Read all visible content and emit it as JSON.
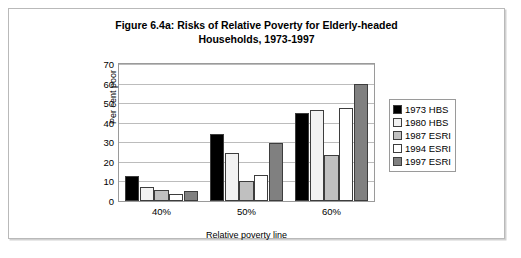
{
  "figure": {
    "title_line1": "Figure 6.4a: Risks of Relative Poverty for Elderly-headed",
    "title_line2": "Households, 1973-1997"
  },
  "chart_data": {
    "type": "bar",
    "title": "Figure 6.4a: Risks of Relative Poverty for Elderly-headed Households, 1973-1997",
    "xlabel": "Relative poverty line",
    "ylabel": "Per cent poor",
    "categories": [
      "40%",
      "50%",
      "60%"
    ],
    "series": [
      {
        "name": "1973 HBS",
        "color": "#000000",
        "values": [
          13,
          34,
          45
        ]
      },
      {
        "name": "1980 HBS",
        "color": "#f2f2f2",
        "values": [
          7,
          24.5,
          46.5
        ]
      },
      {
        "name": "1987 ESRI",
        "color": "#c0c0c0",
        "values": [
          5.5,
          10,
          23.5
        ]
      },
      {
        "name": "1994 ESRI",
        "color": "#ffffff",
        "values": [
          3.5,
          13.5,
          47.5
        ]
      },
      {
        "name": "1997 ESRI",
        "color": "#808080",
        "values": [
          5,
          29.5,
          60
        ]
      }
    ],
    "ylim": [
      0,
      70
    ],
    "yticks": [
      0,
      10,
      20,
      30,
      40,
      50,
      60,
      70
    ],
    "grid": true,
    "legend_position": "right"
  }
}
